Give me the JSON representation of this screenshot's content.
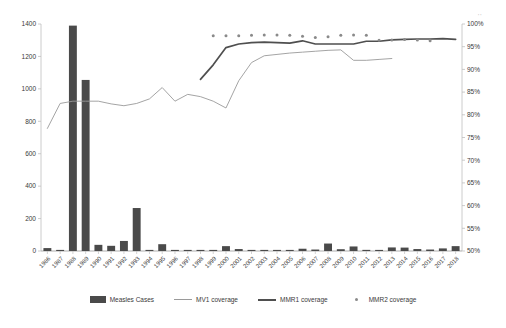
{
  "chart_data": {
    "type": "bar",
    "title": "",
    "xlabel": "",
    "ylabel": "",
    "ylabel_right": "",
    "grid": false,
    "legend_position": "bottom",
    "ylim": [
      0,
      1400
    ],
    "ylim_right": [
      50,
      100
    ],
    "y_ticks": [
      0,
      200,
      400,
      600,
      800,
      1000,
      1200,
      1400
    ],
    "y_ticks_right": [
      "50%",
      "55%",
      "60%",
      "65%",
      "70%",
      "75%",
      "80%",
      "85%",
      "90%",
      "95%",
      "100%"
    ],
    "categories": [
      "1986",
      "1987",
      "1988",
      "1989",
      "1990",
      "1991",
      "1992",
      "1993",
      "1994",
      "1995",
      "1996",
      "1997",
      "1998",
      "1999",
      "2000",
      "2001",
      "2002",
      "2003",
      "2004",
      "2005",
      "2006",
      "2007",
      "2008",
      "2009",
      "2010",
      "2011",
      "2012",
      "2013",
      "2014",
      "2015",
      "2016",
      "2017",
      "2018"
    ],
    "series": [
      {
        "name": "Measles Cases",
        "type": "bar",
        "axis": "left",
        "color": "#4a4a4a",
        "values": [
          18,
          5,
          1390,
          1055,
          38,
          32,
          62,
          265,
          6,
          42,
          3,
          2,
          2,
          1,
          30,
          12,
          5,
          2,
          4,
          6,
          14,
          9,
          46,
          11,
          28,
          7,
          6,
          22,
          21,
          12,
          9,
          16,
          30
        ]
      },
      {
        "name": "MV1 coverage",
        "type": "line",
        "axis": "right",
        "color": "#9a9a9a",
        "values": [
          77.0,
          82.5,
          83.0,
          83.0,
          83.0,
          82.4,
          82.0,
          82.5,
          83.5,
          86.0,
          83.0,
          84.5,
          84.0,
          83.0,
          81.5,
          87.5,
          91.5,
          93.0,
          93.3,
          93.6,
          93.8,
          94.0,
          94.2,
          94.3,
          92.0,
          92.0,
          92.2,
          92.4,
          null,
          null,
          null,
          null,
          null
        ]
      },
      {
        "name": "MMR1 coverage",
        "type": "line",
        "axis": "right",
        "color": "#4f4f4f",
        "values": [
          null,
          null,
          null,
          null,
          null,
          null,
          null,
          null,
          null,
          null,
          null,
          null,
          87.8,
          91.0,
          94.8,
          95.6,
          95.9,
          96.0,
          95.9,
          95.8,
          96.3,
          95.6,
          95.6,
          95.6,
          95.6,
          96.2,
          96.2,
          96.5,
          96.6,
          96.7,
          96.7,
          96.8,
          96.6
        ]
      },
      {
        "name": "MMR2 coverage",
        "type": "scatter",
        "axis": "right",
        "color": "#8a8a8a",
        "values": [
          null,
          null,
          null,
          null,
          null,
          null,
          null,
          null,
          null,
          null,
          null,
          null,
          null,
          97.4,
          97.4,
          97.4,
          97.5,
          97.6,
          97.6,
          97.5,
          97.3,
          97.0,
          97.2,
          97.5,
          97.6,
          97.5,
          96.4,
          96.5,
          96.6,
          96.5,
          96.3,
          null,
          null
        ]
      }
    ]
  },
  "legend": {
    "items": [
      {
        "label": "Measles Cases",
        "marker": "bar-swatch"
      },
      {
        "label": "MV1 coverage",
        "marker": "thin-line-swatch"
      },
      {
        "label": "MMR1 coverage",
        "marker": "thick-line-swatch"
      },
      {
        "label": "MMR2 coverage",
        "marker": "dot-swatch"
      }
    ]
  },
  "artifacts": {
    "top_right_noise": "''"
  }
}
